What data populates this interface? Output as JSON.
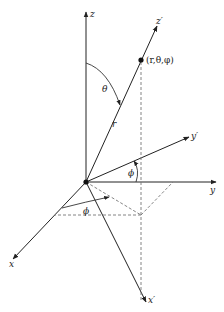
{
  "diagram": {
    "labels": {
      "z": "z",
      "z_prime": "z′",
      "point": "(r,θ,φ)",
      "theta": "θ",
      "r": "r",
      "y_prime": "y′",
      "phi_upper": "ϕ",
      "y": "y",
      "phi_lower": "ϕ",
      "x": "x",
      "x_prime": "x′"
    },
    "colors": {
      "axis": "#222222",
      "dashed": "#777777",
      "background": "#ffffff"
    }
  }
}
